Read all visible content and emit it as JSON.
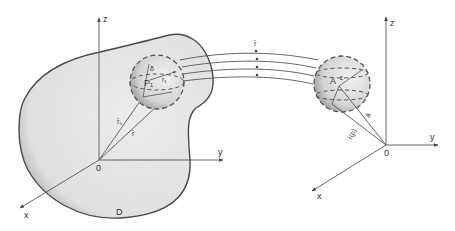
{
  "diagram": {
    "type": "physics-field-diagram",
    "colors": {
      "ink": "#444444",
      "region_fill": "#e6e6e6",
      "sphere_fill": "#d9d9d9",
      "background": "#ffffff"
    },
    "left_frame": {
      "axes": {
        "z": "z",
        "y": "y",
        "x": "x",
        "origin": "0"
      },
      "region_label": "D",
      "sphere": {
        "center_label": "P₁",
        "radius_label": "δ",
        "inner_vector_label": "r₁"
      },
      "vectors": {
        "r0": "r̄₀",
        "r": "r̄"
      }
    },
    "field_lines": {
      "label": "r̄",
      "count": 4
    },
    "right_frame": {
      "axes": {
        "z": "z",
        "y": "y",
        "x": "x",
        "origin": "0"
      },
      "sphere": {
        "center_label": "A",
        "radius_label": "ε"
      },
      "vectors": {
        "a": "ā",
        "rp": "r̄(p)"
      }
    }
  }
}
